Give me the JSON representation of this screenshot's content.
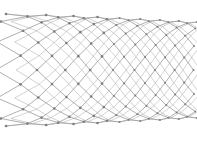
{
  "diagram": {
    "lattice": "hexagonal",
    "colors": {
      "background": "#ffffff",
      "bond": "#9a9a9a",
      "atom": "#7d7d7d"
    },
    "geometry": {
      "left_x": 6,
      "right_x": 197,
      "center_y": 70,
      "left_radius": 56,
      "right_radius": 48,
      "rings_along_axis": 16,
      "atoms_around": 12
    }
  }
}
